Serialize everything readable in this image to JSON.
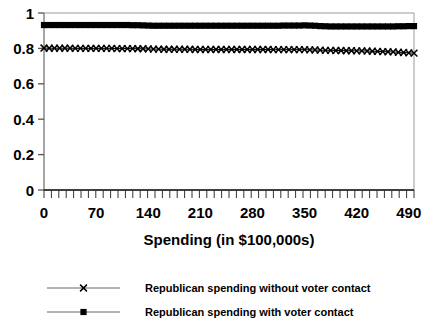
{
  "chart_data": {
    "type": "line",
    "title": "",
    "xlabel": "Spending (in $100,000s)",
    "ylabel": "",
    "xlim": [
      0,
      497
    ],
    "ylim": [
      0,
      1
    ],
    "grid": false,
    "legend_position": "bottom",
    "x_ticks": [
      "0",
      "70",
      "140",
      "210",
      "280",
      "350",
      "420",
      "490"
    ],
    "x_tick_values": [
      0,
      70,
      140,
      210,
      280,
      350,
      420,
      490
    ],
    "y_ticks": [
      "0",
      "0.2",
      "0.4",
      "0.6",
      "0.8",
      "1"
    ],
    "y_tick_values": [
      0,
      0.2,
      0.4,
      0.6,
      0.8,
      1
    ],
    "minor_tick_count": 50,
    "x": [
      0,
      7,
      14,
      21,
      28,
      35,
      42,
      49,
      56,
      63,
      70,
      77,
      84,
      91,
      98,
      105,
      112,
      119,
      126,
      133,
      140,
      147,
      154,
      161,
      168,
      175,
      182,
      189,
      196,
      203,
      210,
      217,
      224,
      231,
      238,
      245,
      252,
      259,
      266,
      273,
      280,
      287,
      294,
      301,
      308,
      315,
      322,
      329,
      336,
      343,
      350,
      357,
      364,
      371,
      378,
      385,
      392,
      399,
      406,
      413,
      420,
      427,
      434,
      441,
      448,
      455,
      462,
      469,
      476,
      483,
      490,
      497
    ],
    "series": [
      {
        "name": "Republican spending with voter contact",
        "marker": "square",
        "color": "#000000",
        "values": [
          0.932,
          0.932,
          0.932,
          0.932,
          0.932,
          0.932,
          0.932,
          0.932,
          0.932,
          0.932,
          0.932,
          0.932,
          0.932,
          0.932,
          0.932,
          0.932,
          0.932,
          0.931,
          0.931,
          0.93,
          0.929,
          0.928,
          0.928,
          0.928,
          0.928,
          0.928,
          0.928,
          0.928,
          0.928,
          0.928,
          0.928,
          0.928,
          0.928,
          0.928,
          0.928,
          0.928,
          0.928,
          0.928,
          0.928,
          0.928,
          0.928,
          0.928,
          0.928,
          0.928,
          0.928,
          0.928,
          0.929,
          0.929,
          0.929,
          0.929,
          0.93,
          0.929,
          0.928,
          0.926,
          0.925,
          0.924,
          0.924,
          0.924,
          0.924,
          0.924,
          0.924,
          0.924,
          0.924,
          0.924,
          0.924,
          0.924,
          0.924,
          0.924,
          0.925,
          0.925,
          0.926,
          0.926
        ]
      },
      {
        "name": "Republican spending without voter contact",
        "marker": "x",
        "color": "#000000",
        "values": [
          0.802,
          0.801,
          0.801,
          0.801,
          0.801,
          0.801,
          0.8,
          0.8,
          0.8,
          0.8,
          0.8,
          0.8,
          0.8,
          0.8,
          0.799,
          0.799,
          0.799,
          0.799,
          0.798,
          0.798,
          0.797,
          0.796,
          0.796,
          0.795,
          0.795,
          0.795,
          0.795,
          0.795,
          0.795,
          0.794,
          0.794,
          0.794,
          0.794,
          0.794,
          0.794,
          0.794,
          0.794,
          0.794,
          0.794,
          0.794,
          0.794,
          0.794,
          0.794,
          0.794,
          0.793,
          0.793,
          0.793,
          0.793,
          0.793,
          0.793,
          0.793,
          0.792,
          0.791,
          0.79,
          0.789,
          0.789,
          0.788,
          0.788,
          0.787,
          0.787,
          0.786,
          0.786,
          0.785,
          0.784,
          0.783,
          0.782,
          0.781,
          0.78,
          0.778,
          0.777,
          0.775,
          0.773
        ]
      }
    ]
  },
  "legend": {
    "items": [
      {
        "label": "Republican spending without voter contact",
        "marker": "x"
      },
      {
        "label": "Republican spending with voter contact",
        "marker": "square"
      }
    ]
  }
}
